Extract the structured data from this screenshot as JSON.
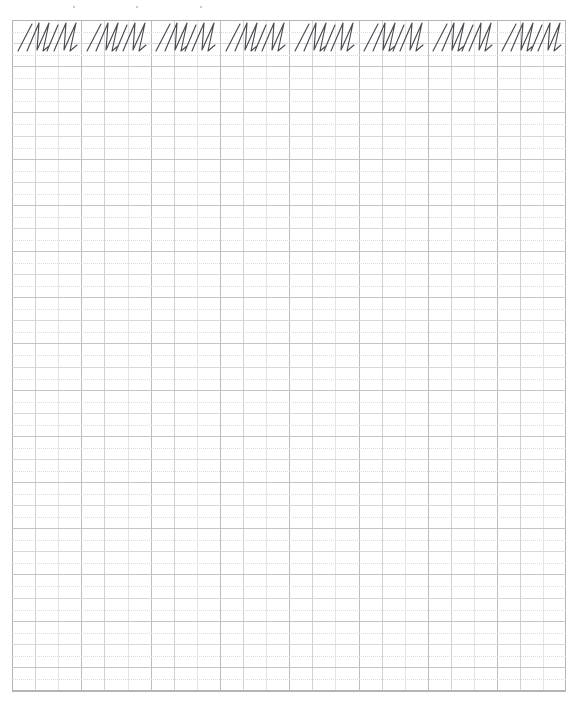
{
  "document": {
    "kind": "handwriting-practice-sheet",
    "title": "Cursive N practice grid",
    "page_width": 583,
    "page_height": 710,
    "background_color": "#ffffff"
  },
  "grid": {
    "left": 12,
    "top": 20,
    "right": 566,
    "bottom": 692,
    "cell_size": 23.1,
    "columns": 24,
    "rows": 29,
    "heavy_every_n_columns": 3,
    "row_has_dotted_midline": true,
    "colors": {
      "light_line": "#e4e4e6",
      "medium_line": "#d2d2d6",
      "heavy_line": "#bcbcc2",
      "edge_line": "#b3b3b8",
      "dotted_line": "#dcdce0",
      "ink": "#4a4a4f"
    }
  },
  "tick_marks": {
    "label": "registration-ticks",
    "count": 3,
    "y": 6,
    "x_positions": [
      73,
      136,
      200
    ],
    "color": "#b9b9b9"
  },
  "writing_row": {
    "label": "model-letter-row",
    "top": 20,
    "height": 34,
    "baseline_offset": 30,
    "letter": "N",
    "script_style": "cursive",
    "group_text": "NN",
    "group_count": 8,
    "group_spacing": 69.2,
    "first_group_left": 16,
    "groups": [
      {
        "index": 1,
        "text": "NN",
        "left": 16
      },
      {
        "index": 2,
        "text": "NN",
        "left": 85
      },
      {
        "index": 3,
        "text": "NN",
        "left": 154
      },
      {
        "index": 4,
        "text": "NN",
        "left": 224
      },
      {
        "index": 5,
        "text": "NN",
        "left": 293
      },
      {
        "index": 6,
        "text": "NN",
        "left": 362
      },
      {
        "index": 7,
        "text": "NN",
        "left": 431
      },
      {
        "index": 8,
        "text": "NN",
        "left": 500
      }
    ]
  }
}
